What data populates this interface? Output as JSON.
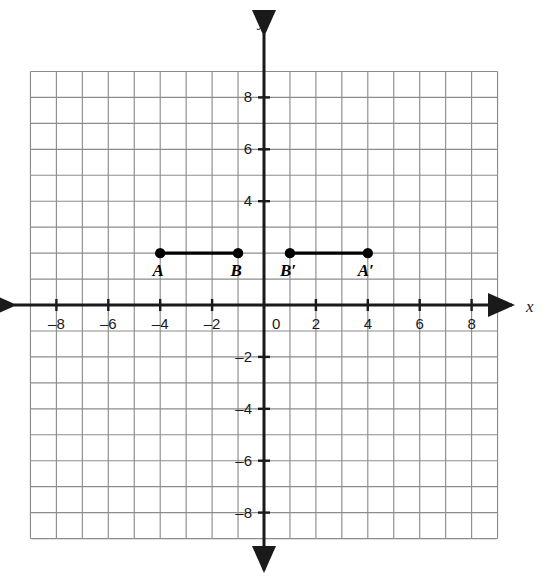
{
  "figure": {
    "kind": "coordinate-plane-diagram",
    "background_color": "#ffffff",
    "grid_color": "#8c8c8c",
    "axis_color": "#1a1a1a",
    "segment_color": "#000000"
  },
  "axes": {
    "x_label": "x",
    "y_label": "y",
    "origin_label": "0",
    "x_min": -9,
    "x_max": 9,
    "y_min": -9,
    "y_max": 9,
    "tick_step": 2,
    "grid_step": 1,
    "x_tick_labels": [
      "-8",
      "-6",
      "-4",
      "-2",
      "2",
      "4",
      "6",
      "8"
    ],
    "x_tick_values": [
      -8,
      -6,
      -4,
      -2,
      2,
      4,
      6,
      8
    ],
    "y_tick_labels": [
      "8",
      "6",
      "4",
      "-2",
      "-4",
      "-6",
      "-8"
    ],
    "y_tick_values": [
      8,
      6,
      4,
      -2,
      -4,
      -6,
      -8
    ]
  },
  "chart_data": {
    "type": "scatter",
    "title": "",
    "xlabel": "x",
    "ylabel": "y",
    "xlim": [
      -9,
      9
    ],
    "ylim": [
      -9,
      9
    ],
    "grid": true,
    "legend": "none",
    "points": [
      {
        "label": "A",
        "x": -4,
        "y": 2
      },
      {
        "label": "B",
        "x": -1,
        "y": 2
      },
      {
        "label": "B'",
        "x": 1,
        "y": 2
      },
      {
        "label": "A'",
        "x": 4,
        "y": 2
      }
    ],
    "segments": [
      {
        "name": "AB",
        "from": "A",
        "to": "B"
      },
      {
        "name": "A'B'",
        "from": "B'",
        "to": "A'"
      }
    ]
  }
}
